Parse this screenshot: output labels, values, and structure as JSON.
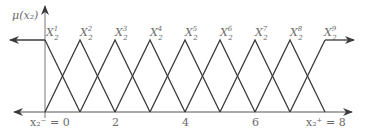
{
  "diagram": {
    "y_axis_label": "μ(x₂)",
    "x_axis": {
      "ticks": [
        {
          "value": 0,
          "label": "x₂⁻ = 0"
        },
        {
          "value": 2,
          "label": "2"
        },
        {
          "value": 4,
          "label": "4"
        },
        {
          "value": 6,
          "label": "6"
        },
        {
          "value": 8,
          "label": "x₂⁺ = 8"
        }
      ],
      "range": [
        0,
        8
      ]
    },
    "membership_functions": [
      {
        "name": "X",
        "sup": "1",
        "sub": "2",
        "center": 0,
        "shape": "left-shoulder"
      },
      {
        "name": "X",
        "sup": "2",
        "sub": "2",
        "center": 1,
        "shape": "triangle"
      },
      {
        "name": "X",
        "sup": "3",
        "sub": "2",
        "center": 2,
        "shape": "triangle"
      },
      {
        "name": "X",
        "sup": "4",
        "sub": "2",
        "center": 3,
        "shape": "triangle"
      },
      {
        "name": "X",
        "sup": "5",
        "sub": "2",
        "center": 4,
        "shape": "triangle"
      },
      {
        "name": "X",
        "sup": "6",
        "sub": "2",
        "center": 5,
        "shape": "triangle"
      },
      {
        "name": "X",
        "sup": "7",
        "sub": "2",
        "center": 6,
        "shape": "triangle"
      },
      {
        "name": "X",
        "sup": "8",
        "sub": "2",
        "center": 7,
        "shape": "triangle"
      },
      {
        "name": "X",
        "sup": "9",
        "sub": "2",
        "center": 8,
        "shape": "right-shoulder"
      }
    ],
    "line_color": "#3a3a3a",
    "axis_color": "#555555"
  }
}
